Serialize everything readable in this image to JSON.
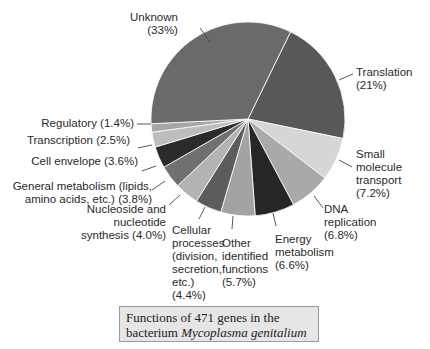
{
  "chart_data": {
    "type": "pie",
    "title": "Functions of 471 genes in the bacterium Mycoplasma genitalium",
    "start_angle_deg": 26,
    "direction": "clockwise",
    "slices": [
      {
        "label": "Translation",
        "value": 21.0,
        "color": "#585858"
      },
      {
        "label": "Small molecule transport",
        "value": 7.2,
        "color": "#d6d6d6"
      },
      {
        "label": "DNA replication",
        "value": 6.8,
        "color": "#a9a9a9"
      },
      {
        "label": "Energy metabolism",
        "value": 6.6,
        "color": "#262626"
      },
      {
        "label": "Other identified functions",
        "value": 5.7,
        "color": "#a3a3a3"
      },
      {
        "label": "Cellular processes (division, secretion, etc.)",
        "value": 4.4,
        "color": "#5c5c5c"
      },
      {
        "label": "Nucleoside and nucleotide synthesis",
        "value": 4.0,
        "color": "#b3b3b3"
      },
      {
        "label": "General metabolism (lipids, amino acids, etc.)",
        "value": 3.8,
        "color": "#707070"
      },
      {
        "label": "Cell envelope",
        "value": 3.6,
        "color": "#2b2b2b"
      },
      {
        "label": "Transcription",
        "value": 2.5,
        "color": "#bdbdbd"
      },
      {
        "label": "Regulatory",
        "value": 1.4,
        "color": "#a6a6a6"
      },
      {
        "label": "Unknown",
        "value": 33.0,
        "color": "#6a6a6a"
      }
    ]
  },
  "labels": {
    "unknown": [
      "Unknown",
      "(33%)"
    ],
    "translation": [
      "Translation",
      "(21%)"
    ],
    "small_molecule": [
      "Small",
      "molecule",
      "transport",
      "(7.2%)"
    ],
    "dna": [
      "DNA",
      "replication",
      "(6.8%)"
    ],
    "energy": [
      "Energy",
      "metabolism",
      "(6.6%)"
    ],
    "other": [
      "Other",
      "identified",
      "functions",
      "(5.7%)"
    ],
    "cellular": [
      "Cellular",
      "processes",
      "(division,",
      "secretion,",
      "etc.)",
      "(4.4%)"
    ],
    "nucleoside": [
      "Nucleoside and",
      "nucleotide",
      "synthesis (4.0%)"
    ],
    "general": [
      "General metabolism (lipids,",
      "amino acids, etc.) (3.8%)"
    ],
    "envelope": [
      "Cell envelope (3.6%)"
    ],
    "transcription": [
      "Transcription (2.5%)"
    ],
    "regulatory": [
      "Regulatory (1.4%)"
    ]
  },
  "caption": {
    "line1": "Functions of 471 genes in the",
    "line2_prefix": "bacterium ",
    "line2_italic": "Mycoplasma genitalium"
  }
}
